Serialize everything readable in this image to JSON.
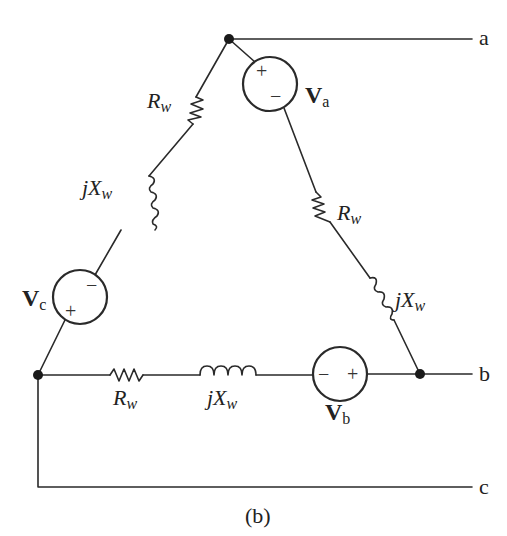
{
  "figure": {
    "caption": "(b)"
  },
  "terminals": {
    "a": "a",
    "b": "b",
    "c": "c"
  },
  "sources": {
    "va": {
      "label_main": "V",
      "label_sub": "a",
      "plus": "+",
      "minus": "−"
    },
    "vb": {
      "label_main": "V",
      "label_sub": "b",
      "plus": "+",
      "minus": "−"
    },
    "vc": {
      "label_main": "V",
      "label_sub": "c",
      "plus": "+",
      "minus": "−"
    }
  },
  "impedances": {
    "left_resistor": {
      "main": "R",
      "sub": "w"
    },
    "left_inductor": {
      "prefix": "jX",
      "sub": "w"
    },
    "right_resistor": {
      "main": "R",
      "sub": "w"
    },
    "right_inductor": {
      "prefix": "jX",
      "sub": "w"
    },
    "bottom_resistor": {
      "main": "R",
      "sub": "w"
    },
    "bottom_inductor": {
      "prefix": "jX",
      "sub": "w"
    }
  }
}
